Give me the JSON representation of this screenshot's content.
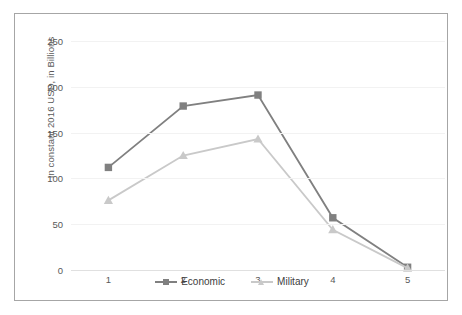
{
  "chart_data": {
    "type": "line",
    "title": "",
    "xlabel": "",
    "ylabel": "In constant 2016 USD, in Billions",
    "x": [
      1,
      2,
      3,
      4,
      5
    ],
    "categories": [
      "1",
      "2",
      "3",
      "4",
      "5"
    ],
    "series": [
      {
        "name": "Economic",
        "values": [
          112,
          179,
          191,
          57,
          3
        ],
        "color": "#808080",
        "marker": "square"
      },
      {
        "name": "Military",
        "values": [
          76,
          125,
          143,
          44,
          2
        ],
        "color": "#c9c9c9",
        "marker": "triangle"
      }
    ],
    "ylim": [
      0,
      250
    ],
    "yticks": [
      0,
      50,
      100,
      150,
      200,
      250
    ],
    "ytick_labels": [
      "0",
      "50",
      "100",
      "150",
      "200",
      "250"
    ],
    "xtick_labels": [
      "1",
      "2",
      "3",
      "4",
      "5"
    ],
    "grid": "horizontal",
    "legend_position": "bottom",
    "legend": [
      "Economic",
      "Military"
    ],
    "frame": "#a6a6a6",
    "gridline_color": "#f2f2f2",
    "tick_label_color": "#595959"
  }
}
